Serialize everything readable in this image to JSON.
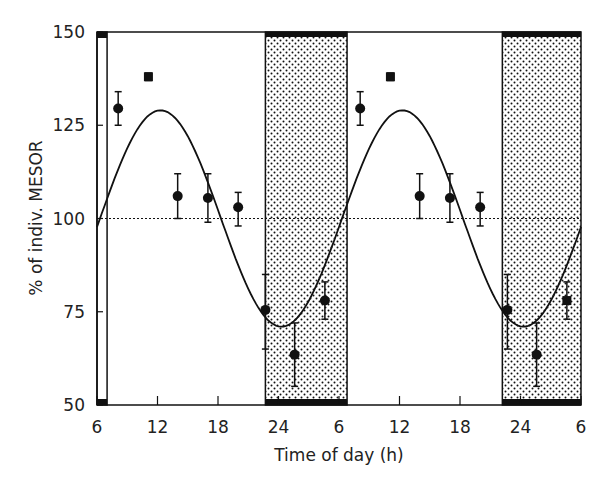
{
  "chart_data": {
    "type": "scatter",
    "title": "",
    "xlabel": "Time of day (h)",
    "ylabel": "% of indiv. MESOR",
    "ylim": [
      50,
      150
    ],
    "xlim_hours": [
      0,
      48
    ],
    "x_ticks": [
      {
        "h": 0,
        "label": "6"
      },
      {
        "h": 6,
        "label": "12"
      },
      {
        "h": 12,
        "label": "18"
      },
      {
        "h": 18,
        "label": "24"
      },
      {
        "h": 24,
        "label": "6"
      },
      {
        "h": 30,
        "label": "12"
      },
      {
        "h": 36,
        "label": "18"
      },
      {
        "h": 42,
        "label": "24"
      },
      {
        "h": 48,
        "label": "6"
      }
    ],
    "y_ticks": [
      50,
      75,
      100,
      125,
      150
    ],
    "reference_line": {
      "y": 100,
      "style": "dotted",
      "label": "MESOR"
    },
    "dark_periods": [
      {
        "start_h": 16.7,
        "end_h": 24.8
      },
      {
        "start_h": 40.2,
        "end_h": 48
      }
    ],
    "light_edge_box": {
      "start_h": 0,
      "end_h": 1.0
    },
    "cosinor_fit": {
      "mesor": 100,
      "amplitude": 29,
      "acrophase_clock_h": 12.3,
      "period_h": 24
    },
    "series": [
      {
        "name": "observed means (± SE)",
        "points": [
          {
            "clock": "8",
            "h": 2.1,
            "y": 129.5,
            "lo": 125,
            "hi": 134,
            "marker": "circle"
          },
          {
            "clock": "11",
            "h": 5.1,
            "y": 138,
            "lo": 137,
            "hi": 139,
            "marker": "square"
          },
          {
            "clock": "14",
            "h": 8.0,
            "y": 106,
            "lo": 100,
            "hi": 112,
            "marker": "circle"
          },
          {
            "clock": "17",
            "h": 11.0,
            "y": 105.5,
            "lo": 99,
            "hi": 112,
            "marker": "circle"
          },
          {
            "clock": "20",
            "h": 14.0,
            "y": 103,
            "lo": 98,
            "hi": 107,
            "marker": "circle"
          },
          {
            "clock": "22.5",
            "h": 16.7,
            "y": 75.5,
            "lo": 65,
            "hi": 85,
            "marker": "circle"
          },
          {
            "clock": "2",
            "h": 19.6,
            "y": 63.5,
            "lo": 55,
            "hi": 72,
            "marker": "circle"
          },
          {
            "clock": "5",
            "h": 22.6,
            "y": 78,
            "lo": 73,
            "hi": 83,
            "marker": "circle"
          },
          {
            "clock": "8",
            "h": 26.1,
            "y": 129.5,
            "lo": 125,
            "hi": 134,
            "marker": "circle"
          },
          {
            "clock": "11",
            "h": 29.1,
            "y": 138,
            "lo": 137,
            "hi": 139,
            "marker": "square"
          },
          {
            "clock": "14",
            "h": 32.0,
            "y": 106,
            "lo": 100,
            "hi": 112,
            "marker": "circle"
          },
          {
            "clock": "17",
            "h": 35.0,
            "y": 105.5,
            "lo": 99,
            "hi": 112,
            "marker": "circle"
          },
          {
            "clock": "20",
            "h": 38.0,
            "y": 103,
            "lo": 98,
            "hi": 107,
            "marker": "circle"
          },
          {
            "clock": "22.5",
            "h": 40.7,
            "y": 75.5,
            "lo": 65,
            "hi": 85,
            "marker": "circle"
          },
          {
            "clock": "2",
            "h": 43.6,
            "y": 63.5,
            "lo": 55,
            "hi": 72,
            "marker": "circle"
          },
          {
            "clock": "5",
            "h": 46.6,
            "y": 78,
            "lo": 73,
            "hi": 83,
            "marker": "square"
          }
        ]
      }
    ],
    "grid": false,
    "legend": "none"
  },
  "labels": {
    "ylabel": "% of indiv. MESOR",
    "xlabel": "Time of day (h)"
  }
}
